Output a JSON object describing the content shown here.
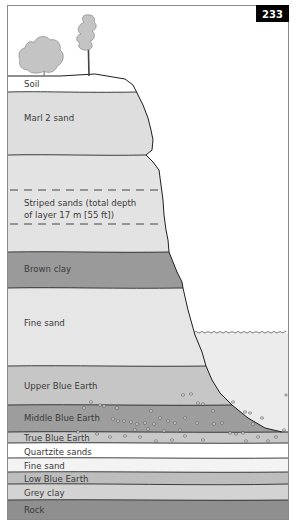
{
  "page_number": "233",
  "colors": {
    "sky": "#ffffff",
    "frame": "#8a8a8a",
    "badge_bg": "#000000",
    "badge_text": "#ffffff",
    "sea": "#ececec",
    "outline": "#2a2a2a"
  },
  "layers": [
    {
      "label": "Soil",
      "color": "#ffffff"
    },
    {
      "label": "Marl 2 sand",
      "color": "#dedede"
    },
    {
      "label": "Striped sands (total depth",
      "label_line2": "of layer 17 m [55 ft])",
      "color": "#e3e3e3"
    },
    {
      "label": "Brown clay",
      "color": "#9a9a9a"
    },
    {
      "label": "Fine sand",
      "color": "#e6e6e6"
    },
    {
      "label": "Upper Blue Earth",
      "color": "#c6c6c6"
    },
    {
      "label": "Middle Blue Earth",
      "color": "#9d9d9d"
    },
    {
      "label": "True Blue Earth",
      "color": "#c8c8c8"
    },
    {
      "label": "Quartzite sands",
      "color": "#ffffff"
    },
    {
      "label": "Fine sand",
      "color": "#f3f3f3"
    },
    {
      "label": "Low Blue Earth",
      "color": "#bdbdbd"
    },
    {
      "label": "Grey clay",
      "color": "#d3d3d3"
    },
    {
      "label": "Rock",
      "color": "#8f8f8f"
    }
  ],
  "illustrations": {
    "trees": [
      "deciduous-tree",
      "pine-tree"
    ],
    "sea": "water-surface-wavy",
    "pebbles": "scattered-pebbles"
  }
}
